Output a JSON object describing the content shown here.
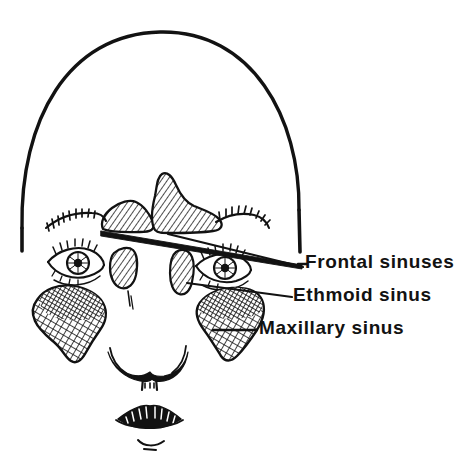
{
  "figure": {
    "kind": "anatomical-line-drawing",
    "background_color": "#ffffff",
    "ink_color": "#121212"
  },
  "caption": {
    "text": "the sinuses",
    "note": "cropped at top edge of image, only descenders visible"
  },
  "labels": [
    {
      "id": "frontal",
      "text": "Frontal sinuses",
      "leader": "long tapered wedge running up-left to the two hatched frontal sinus shapes above the eyebrows"
    },
    {
      "id": "ethmoid",
      "text": "Ethmoid sinus",
      "leader": "thin line running left to the narrow vertical hatched shape beside the right eye"
    },
    {
      "id": "maxillary",
      "text": "Maxillary sinus",
      "leader": "short straight line to the large cross-hatched cheek shape"
    }
  ],
  "anatomy": {
    "head_outline": "dome / arch shaped cranium outline",
    "features": [
      "left eyebrow",
      "right eyebrow",
      "left eye",
      "right eye",
      "nose",
      "nostrils",
      "upper lip",
      "lower lip",
      "chin crease"
    ],
    "sinus_regions": [
      "frontal sinus left",
      "frontal sinus right",
      "ethmoid sinus left",
      "ethmoid sinus right",
      "maxillary sinus left",
      "maxillary sinus right"
    ]
  },
  "colors": {
    "ink": "#121212",
    "paper": "#ffffff"
  }
}
